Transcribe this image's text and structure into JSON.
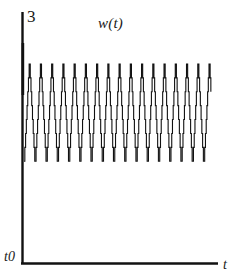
{
  "figure": {
    "background_color": "#ffffff",
    "ink_color": "#111111",
    "width": 237,
    "height": 280
  },
  "labels": {
    "y_axis_max": "3",
    "series_title": "w(t)",
    "origin": "t0",
    "x_axis": "t"
  },
  "chart_data": {
    "type": "line",
    "title": "w(t)",
    "xlabel": "t",
    "ylabel": "",
    "xlim": [
      0,
      20
    ],
    "ylim": [
      0,
      3
    ],
    "grid": false,
    "legend": null,
    "axis_style": "two-axis-corner",
    "y_tick_labels": [
      "3"
    ],
    "x_tick_labels": [
      "t0"
    ],
    "series": [
      {
        "name": "w(t)",
        "color": "#111111",
        "line_width": 1.1,
        "waveform": "quantized-sine",
        "cycles": 17,
        "period_x": 1.15,
        "mean_level": 1.8,
        "amplitude": 0.58,
        "quantization_steps": 7,
        "x_start": 0.15,
        "x_end": 19.3,
        "y_top": 2.4,
        "y_bottom": 1.22
      }
    ]
  }
}
